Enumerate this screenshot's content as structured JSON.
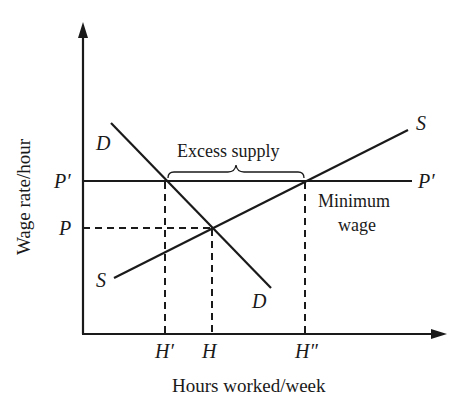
{
  "diagram": {
    "axes": {
      "x_label": "Hours worked/week",
      "y_label": "Wage rate/hour"
    },
    "price_levels": {
      "p_prime": "P′",
      "p": "P",
      "p_prime_right": "P′"
    },
    "quantity_levels": {
      "h_prime": "H′",
      "h": "H",
      "h_double_prime": "H″"
    },
    "curves": {
      "demand_top": "D",
      "demand_bottom": "D",
      "supply_top": "S",
      "supply_bottom": "S"
    },
    "annotations": {
      "excess_supply": "Excess supply",
      "minimum_wage_line1": "Minimum",
      "minimum_wage_line2": "wage"
    },
    "colors": {
      "ink": "#1a1a1a",
      "background": "#ffffff"
    }
  }
}
